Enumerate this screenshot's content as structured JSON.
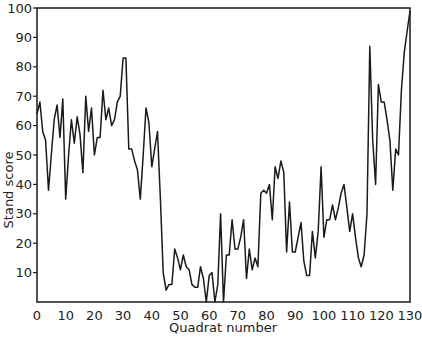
{
  "chart_data": {
    "type": "line",
    "title": "",
    "xlabel": "Quadrat number",
    "ylabel": "Stand score",
    "xlim": [
      0,
      130
    ],
    "ylim": [
      0,
      100
    ],
    "grid": false,
    "legend": null,
    "xticks": [
      0,
      10,
      20,
      30,
      40,
      50,
      60,
      70,
      80,
      90,
      100,
      110,
      120,
      130
    ],
    "yticks": [
      10,
      20,
      30,
      40,
      50,
      60,
      70,
      80,
      90,
      100
    ],
    "series": [
      {
        "name": "Stand score",
        "color": "#1a1a1a",
        "x": [
          0,
          1,
          2,
          3,
          4,
          5,
          6,
          7,
          8,
          9,
          10,
          11,
          12,
          13,
          14,
          15,
          16,
          17,
          18,
          19,
          20,
          21,
          22,
          23,
          24,
          25,
          26,
          27,
          28,
          29,
          30,
          31,
          32,
          33,
          34,
          35,
          36,
          37,
          38,
          39,
          40,
          41,
          42,
          43,
          44,
          45,
          46,
          47,
          48,
          49,
          50,
          51,
          52,
          53,
          54,
          55,
          56,
          57,
          58,
          59,
          60,
          61,
          62,
          63,
          64,
          65,
          66,
          67,
          68,
          69,
          70,
          71,
          72,
          73,
          74,
          75,
          76,
          77,
          78,
          79,
          80,
          81,
          82,
          83,
          84,
          85,
          86,
          87,
          88,
          89,
          90,
          91,
          92,
          93,
          94,
          95,
          96,
          97,
          98,
          99,
          100,
          101,
          102,
          103,
          104,
          105,
          106,
          107,
          108,
          109,
          110,
          111,
          112,
          113,
          114,
          115,
          116,
          117,
          118,
          119,
          120,
          121,
          122,
          123,
          124,
          125,
          126,
          127,
          128,
          129,
          130
        ],
        "values": [
          64,
          68,
          58,
          55,
          38,
          50,
          62,
          67,
          56,
          69,
          35,
          50,
          62,
          54,
          63,
          57,
          44,
          70,
          58,
          66,
          50,
          56,
          56,
          72,
          62,
          66,
          60,
          62,
          68,
          70,
          83,
          83,
          52,
          52,
          48,
          45,
          35,
          50,
          66,
          61,
          46,
          52,
          58,
          35,
          10,
          4,
          6,
          6,
          18,
          15,
          11,
          16,
          12,
          11,
          6,
          5,
          5,
          12,
          8,
          0,
          9,
          10,
          0,
          6,
          30,
          0,
          16,
          16,
          28,
          18,
          18,
          22,
          28,
          8,
          18,
          11,
          15,
          12,
          37,
          38,
          37,
          40,
          28,
          46,
          42,
          48,
          44,
          17,
          34,
          17,
          17,
          22,
          27,
          14,
          9,
          9,
          24,
          15,
          24,
          46,
          22,
          28,
          28,
          33,
          28,
          32,
          37,
          40,
          32,
          24,
          30,
          22,
          15,
          12,
          16,
          30,
          87,
          55,
          40,
          74,
          68,
          68,
          62,
          55,
          38,
          52,
          50,
          72,
          85,
          92,
          99
        ]
      }
    ]
  }
}
